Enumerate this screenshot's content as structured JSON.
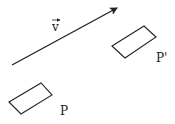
{
  "diagram": {
    "vector": {
      "label": "v",
      "start": [
        12,
        65
      ],
      "end": [
        118,
        7
      ],
      "color": "#222222"
    },
    "shapes": [
      {
        "name": "P",
        "label": "P",
        "points": [
          [
            9,
            102
          ],
          [
            41,
            83
          ],
          [
            52,
            95
          ],
          [
            21,
            114
          ]
        ],
        "label_pos": [
          60,
          115
        ]
      },
      {
        "name": "P-prime",
        "label": "P'",
        "points": [
          [
            112,
            46
          ],
          [
            144,
            26
          ],
          [
            156,
            37
          ],
          [
            125,
            58
          ]
        ],
        "label_pos": [
          156,
          62
        ]
      }
    ],
    "stroke_color": "#222222"
  }
}
